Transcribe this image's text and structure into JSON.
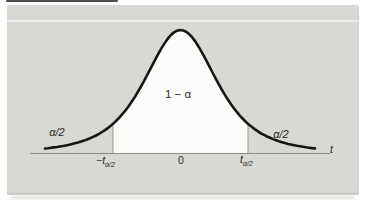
{
  "figure": {
    "labels": {
      "left_tail": "α/2",
      "right_tail": "α/2",
      "center_region": "1 − α",
      "zero_tick": "0",
      "left_critical_prefix": "−t",
      "left_critical_sub": "α/2",
      "right_critical_prefix": "t",
      "right_critical_sub": "α/2",
      "axis_variable": "t"
    },
    "colors": {
      "panel": "#d8d8d4",
      "curve": "#161616",
      "under_curve_fill": "#fcfcfa",
      "axis_line": "#8c8c85",
      "boundary_line": "#9a9a93",
      "text": "#2a2a28"
    }
  },
  "curve": {
    "shape": "student-t-pdf",
    "center_x": 180.5,
    "scale": 38,
    "df": 3,
    "amplitude": 123,
    "baseline_y": 153,
    "x_start": 45,
    "x_end": 315,
    "left_boundary_x": 113,
    "right_boundary_x": 248,
    "axis_x_start": 30,
    "axis_x_end": 330
  }
}
